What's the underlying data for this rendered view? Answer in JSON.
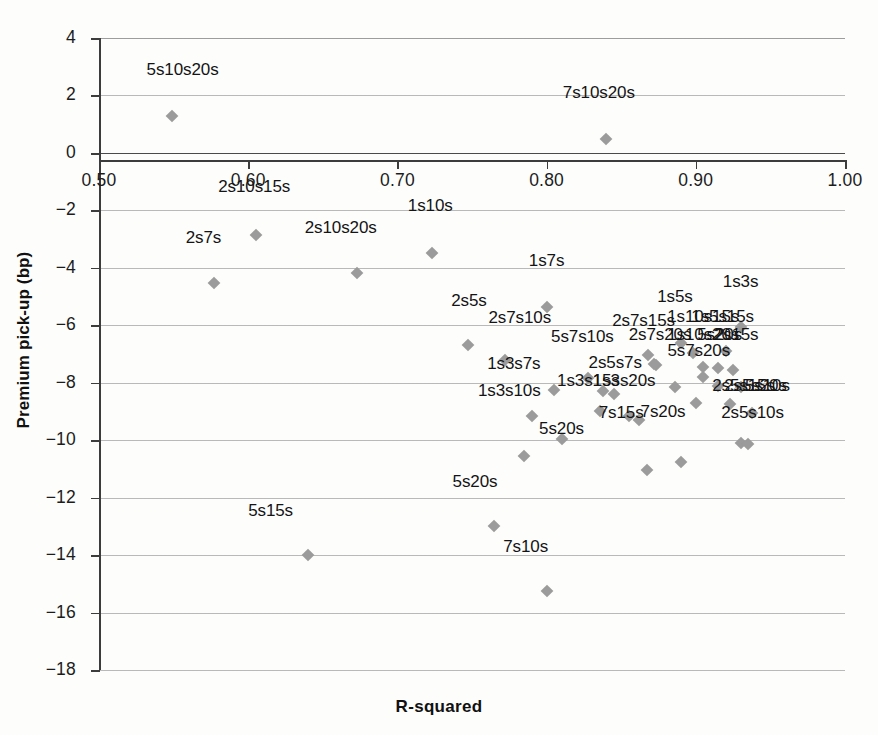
{
  "chart_data": {
    "type": "scatter",
    "title": "",
    "xlabel": "R-squared",
    "ylabel": "Premium pick-up (bp)",
    "xlim": [
      0.5,
      1.0
    ],
    "ylim": [
      -18,
      4
    ],
    "grid": true,
    "legend": "none",
    "xticks": [
      "0.50",
      "0.60",
      "0.70",
      "0.80",
      "0.90",
      "1.00"
    ],
    "xtick_values": [
      0.5,
      0.6,
      0.7,
      0.8,
      0.9,
      1.0
    ],
    "yticks": [
      "4",
      "2",
      "0",
      "−2",
      "−4",
      "−6",
      "−8",
      "−10",
      "−12",
      "−14",
      "−16",
      "−18"
    ],
    "ytick_values": [
      4,
      2,
      0,
      -2,
      -4,
      -6,
      -8,
      -10,
      -12,
      -14,
      -16,
      -18
    ],
    "marker_color": "#9b9b9b",
    "axis_color": "#3c3c3c",
    "grid_color": "#b9b9b9",
    "points": [
      {
        "label": "5s10s20s",
        "x": 0.549,
        "y": 1.3,
        "lx": 0.556,
        "ly": 2.55
      },
      {
        "label": "7s10s20s",
        "x": 0.84,
        "y": 0.48,
        "lx": 0.835,
        "ly": 1.75
      },
      {
        "label": "2s10s15s",
        "x": 0.605,
        "y": -2.85,
        "lx": 0.604,
        "ly": -1.55
      },
      {
        "label": "2s7s",
        "x": 0.577,
        "y": -4.52,
        "lx": 0.57,
        "ly": -3.3
      },
      {
        "label": "2s10s20s",
        "x": 0.673,
        "y": -4.18,
        "lx": 0.662,
        "ly": -2.95
      },
      {
        "label": "1s10s",
        "x": 0.723,
        "y": -3.48,
        "lx": 0.722,
        "ly": -2.2
      },
      {
        "label": "1s7s",
        "x": 0.8,
        "y": -5.35,
        "lx": 0.8,
        "ly": -4.1
      },
      {
        "label": "1s3s",
        "x": 0.93,
        "y": -6.05,
        "lx": 0.93,
        "ly": -4.85
      },
      {
        "label": "1s5s",
        "x": 0.89,
        "y": -6.6,
        "lx": 0.886,
        "ly": -5.35
      },
      {
        "label": "1s10s15s",
        "x": 0.898,
        "y": -6.95,
        "lx": 0.905,
        "ly": -6.05
      },
      {
        "label": "1s5s15s",
        "x": 0.92,
        "y": -6.9,
        "lx": 0.918,
        "ly": -6.05
      },
      {
        "label": "2s5s",
        "x": 0.747,
        "y": -6.7,
        "lx": 0.748,
        "ly": -5.5
      },
      {
        "label": "2s7s10s",
        "x": 0.772,
        "y": -7.2,
        "lx": 0.782,
        "ly": -6.1
      },
      {
        "label": "2s7s15s",
        "x": 0.868,
        "y": -7.05,
        "lx": 0.865,
        "ly": -6.2
      },
      {
        "label": "2s7s20s",
        "x": 0.872,
        "y": -7.35,
        "lx": 0.876,
        "ly": -6.7
      },
      {
        "label": "1s10s20s",
        "x": 0.905,
        "y": -7.45,
        "lx": 0.905,
        "ly": -6.7
      },
      {
        "label": "5s20s",
        "x": 0.915,
        "y": -7.5,
        "lx": 0.916,
        "ly": -6.7
      },
      {
        "label": "2s15s",
        "x": 0.925,
        "y": -7.55,
        "lx": 0.927,
        "ly": -6.7
      },
      {
        "label": "5s7s10s",
        "x": 0.828,
        "y": -7.85,
        "lx": 0.824,
        "ly": -6.75
      },
      {
        "label": "5s7s20s",
        "x": 0.905,
        "y": -7.8,
        "lx": 0.902,
        "ly": -7.25
      },
      {
        "label": "1s3s7s",
        "x": 0.805,
        "y": -8.25,
        "lx": 0.778,
        "ly": -7.7
      },
      {
        "label": "2s5s7s",
        "x": 0.845,
        "y": -8.4,
        "lx": 0.846,
        "ly": -7.65
      },
      {
        "label": "1s3s15s",
        "x": 0.836,
        "y": -9.0,
        "lx": 0.828,
        "ly": -8.3
      },
      {
        "label": "1s3s20s",
        "x": 0.855,
        "y": -9.15,
        "lx": 0.852,
        "ly": -8.3
      },
      {
        "label": "2s5s20s",
        "x": 0.93,
        "y": -8.15,
        "lx": 0.94,
        "ly": -8.45
      },
      {
        "label": "5s10s",
        "x": 0.938,
        "y": -9.05,
        "lx": 0.948,
        "ly": -8.45
      },
      {
        "label": "2s5s15s",
        "x": 0.923,
        "y": -8.75,
        "lx": 0.932,
        "ly": -8.45
      },
      {
        "label": "2s5s10s",
        "x": 0.935,
        "y": -10.15,
        "lx": 0.938,
        "ly": -9.4
      },
      {
        "label": "1s3s10s",
        "x": 0.79,
        "y": -9.15,
        "lx": 0.775,
        "ly": -8.65
      },
      {
        "label": "7s15s",
        "x": 0.862,
        "y": -9.3,
        "lx": 0.85,
        "ly": -9.4
      },
      {
        "label": "7s20s",
        "x": 0.89,
        "y": -10.75,
        "lx": 0.878,
        "ly": -9.35
      },
      {
        "label": "5s20s-b",
        "x": 0.81,
        "y": -9.95,
        "lx": 0.81,
        "ly": -9.95
      },
      {
        "label": "",
        "x": 0.785,
        "y": -10.55,
        "lx": 0.785,
        "ly": -10.55
      },
      {
        "label": "",
        "x": 0.867,
        "y": -11.05,
        "lx": 0.867,
        "ly": -11.05
      },
      {
        "label": "5s20s-c",
        "x": 0.765,
        "y": -13.0,
        "lx": 0.752,
        "ly": -11.8
      },
      {
        "label": "5s15s",
        "x": 0.64,
        "y": -14.0,
        "lx": 0.615,
        "ly": -12.8
      },
      {
        "label": "7s10s",
        "x": 0.8,
        "y": -15.25,
        "lx": 0.786,
        "ly": -14.05
      }
    ]
  },
  "extra_markers": [
    {
      "x": 0.838,
      "y": -8.3
    },
    {
      "x": 0.886,
      "y": -8.15
    },
    {
      "x": 0.915,
      "y": -8.12
    },
    {
      "x": 0.9,
      "y": -8.7
    },
    {
      "x": 0.873,
      "y": -7.4
    },
    {
      "x": 0.93,
      "y": -10.1
    }
  ],
  "labels": {
    "overlap_note": ""
  }
}
